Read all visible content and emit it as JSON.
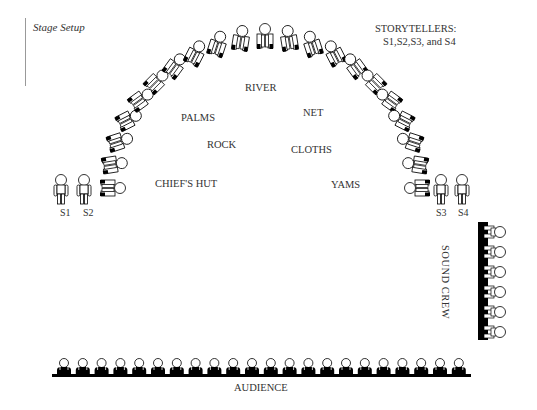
{
  "title": "Stage Setup",
  "legend": {
    "heading": "STORYTELLERS:",
    "members": "S1,S2,S3, and S4"
  },
  "props": [
    {
      "label": "RIVER",
      "x": 245,
      "y": 82
    },
    {
      "label": "PALMS",
      "x": 181,
      "y": 112
    },
    {
      "label": "NET",
      "x": 303,
      "y": 107
    },
    {
      "label": "ROCK",
      "x": 207,
      "y": 139
    },
    {
      "label": "CLOTHS",
      "x": 291,
      "y": 144
    },
    {
      "label": "CHIEF'S HUT",
      "x": 155,
      "y": 178
    },
    {
      "label": "YAMS",
      "x": 331,
      "y": 179
    }
  ],
  "storytellers": [
    {
      "label": "S1",
      "x": 60
    },
    {
      "label": "S2",
      "x": 83
    },
    {
      "label": "S3",
      "x": 436
    },
    {
      "label": "S4",
      "x": 458
    }
  ],
  "arc": {
    "count": 21,
    "cx": 265,
    "cy": 188,
    "r": 152
  },
  "sound_crew": {
    "label": "SOUND CREW",
    "count": 6
  },
  "audience": {
    "label": "AUDIENCE",
    "count": 22
  },
  "colors": {
    "ink": "#000000",
    "text": "#333333",
    "rule": "#999999"
  }
}
